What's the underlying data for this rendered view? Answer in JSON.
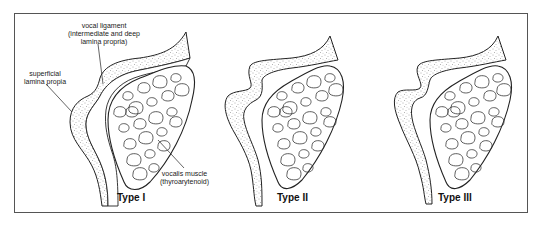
{
  "figure": {
    "panels": [
      {
        "id": "type-1",
        "title": "Type I"
      },
      {
        "id": "type-2",
        "title": "Type II"
      },
      {
        "id": "type-3",
        "title": "Type III"
      }
    ],
    "labels": {
      "vocal_ligament": {
        "line1": "vocal ligament",
        "line2": "(intermediate and deep",
        "line3": "lamina propria)"
      },
      "superficial": {
        "line1": "superficial",
        "line2": "lamina propia"
      },
      "vocalis": {
        "line1": "vocalis muscle",
        "line2": "(thyroarytenoid)"
      }
    },
    "colors": {
      "stroke": "#222222",
      "stipple": "#555555",
      "frame": "#555555"
    }
  }
}
